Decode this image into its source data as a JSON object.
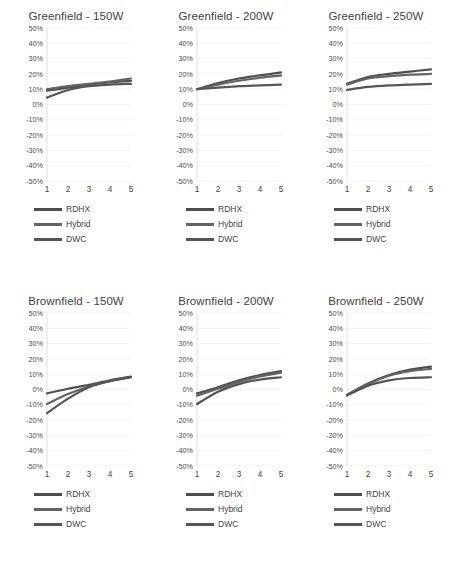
{
  "figure": {
    "series_names": [
      "RDHX",
      "Hybrid",
      "DWC"
    ],
    "series_colors": [
      "#4f4f4f",
      "#636363",
      "#555555"
    ],
    "x_categories": [
      "1",
      "2",
      "3",
      "4",
      "5"
    ],
    "y_ticks": [
      "50%",
      "40%",
      "30%",
      "20%",
      "10%",
      "0%",
      "-10%",
      "-20%",
      "-30%",
      "-40%",
      "-50%"
    ],
    "ylim": [
      -50,
      50
    ],
    "gridline_color": "#f0f0f0",
    "axis_color": "#d9d9d9"
  },
  "panels": [
    {
      "id": "greenfield-150w",
      "title": "Greenfield - 150W",
      "legend": [
        "RDHX",
        "Hybrid",
        "DWC"
      ]
    },
    {
      "id": "greenfield-200w",
      "title": "Greenfield - 200W",
      "legend": [
        "RDHX",
        "Hybrid",
        "DWC"
      ]
    },
    {
      "id": "greenfield-250w",
      "title": "Greenfield - 250W",
      "legend": [
        "RDHX",
        "Hybrid",
        "DWC"
      ]
    },
    {
      "id": "brownfield-150w",
      "title": "Brownfield - 150W",
      "legend": [
        "RDHX",
        "Hybrid",
        "DWC"
      ]
    },
    {
      "id": "brownfield-200w",
      "title": "Brownfield - 200W",
      "legend": [
        "RDHX",
        "Hybrid",
        "DWC"
      ]
    },
    {
      "id": "brownfield-250w",
      "title": "Brownfield - 250W",
      "legend": [
        "RDHX",
        "Hybrid",
        "DWC"
      ]
    }
  ],
  "chart_data": [
    {
      "type": "line",
      "title": "Greenfield - 150W",
      "xlabel": "",
      "ylabel": "",
      "x": [
        1,
        2,
        3,
        4,
        5
      ],
      "categories": [
        "1",
        "2",
        "3",
        "4",
        "5"
      ],
      "ylim": [
        -50,
        50
      ],
      "yticks": [
        -50,
        -40,
        -30,
        -20,
        -10,
        0,
        10,
        20,
        30,
        40,
        50
      ],
      "ytick_labels": [
        "-50%",
        "-40%",
        "-30%",
        "-20%",
        "-10%",
        "0%",
        "10%",
        "20%",
        "30%",
        "40%",
        "50%"
      ],
      "grid": true,
      "legend": "below",
      "series": [
        {
          "name": "RDHX",
          "values": [
            9,
            11,
            13,
            14.5,
            15.5
          ]
        },
        {
          "name": "Hybrid",
          "values": [
            10,
            12,
            13.5,
            15,
            17
          ]
        },
        {
          "name": "DWC",
          "values": [
            4.5,
            9.5,
            12,
            13,
            13.5
          ]
        }
      ]
    },
    {
      "type": "line",
      "title": "Greenfield - 200W",
      "xlabel": "",
      "ylabel": "",
      "x": [
        1,
        2,
        3,
        4,
        5
      ],
      "categories": [
        "1",
        "2",
        "3",
        "4",
        "5"
      ],
      "ylim": [
        -50,
        50
      ],
      "yticks": [
        -50,
        -40,
        -30,
        -20,
        -10,
        0,
        10,
        20,
        30,
        40,
        50
      ],
      "ytick_labels": [
        "-50%",
        "-40%",
        "-30%",
        "-20%",
        "-10%",
        "0%",
        "10%",
        "20%",
        "30%",
        "40%",
        "50%"
      ],
      "grid": true,
      "legend": "below",
      "series": [
        {
          "name": "RDHX",
          "values": [
            10,
            14,
            17,
            19,
            21
          ]
        },
        {
          "name": "Hybrid",
          "values": [
            10,
            13,
            15.5,
            17.5,
            19
          ]
        },
        {
          "name": "DWC",
          "values": [
            10,
            11,
            12,
            12.5,
            13
          ]
        }
      ]
    },
    {
      "type": "line",
      "title": "Greenfield - 250W",
      "xlabel": "",
      "ylabel": "",
      "x": [
        1,
        2,
        3,
        4,
        5
      ],
      "categories": [
        "1",
        "2",
        "3",
        "4",
        "5"
      ],
      "ylim": [
        -50,
        50
      ],
      "yticks": [
        -50,
        -40,
        -30,
        -20,
        -10,
        0,
        10,
        20,
        30,
        40,
        50
      ],
      "ytick_labels": [
        "-50%",
        "-40%",
        "-30%",
        "-20%",
        "-10%",
        "0%",
        "10%",
        "20%",
        "30%",
        "40%",
        "50%"
      ],
      "grid": true,
      "legend": "below",
      "series": [
        {
          "name": "RDHX",
          "values": [
            13.5,
            18,
            20,
            21.5,
            23
          ]
        },
        {
          "name": "Hybrid",
          "values": [
            13,
            17,
            18.5,
            19.5,
            20
          ]
        },
        {
          "name": "DWC",
          "values": [
            9.5,
            11.5,
            12.5,
            13,
            13.5
          ]
        }
      ]
    },
    {
      "type": "line",
      "title": "Brownfield - 150W",
      "xlabel": "",
      "ylabel": "",
      "x": [
        1,
        2,
        3,
        4,
        5
      ],
      "categories": [
        "1",
        "2",
        "3",
        "4",
        "5"
      ],
      "ylim": [
        -50,
        50
      ],
      "yticks": [
        -50,
        -40,
        -30,
        -20,
        -10,
        0,
        10,
        20,
        30,
        40,
        50
      ],
      "ytick_labels": [
        "-50%",
        "-40%",
        "-30%",
        "-20%",
        "-10%",
        "0%",
        "10%",
        "20%",
        "30%",
        "40%",
        "50%"
      ],
      "grid": true,
      "legend": "below",
      "series": [
        {
          "name": "RDHX",
          "values": [
            -2.5,
            0.5,
            3,
            6,
            8.5
          ]
        },
        {
          "name": "Hybrid",
          "values": [
            -9.5,
            -3,
            2,
            5.5,
            8
          ]
        },
        {
          "name": "DWC",
          "values": [
            -15.5,
            -6,
            1.5,
            5.5,
            8
          ]
        }
      ]
    },
    {
      "type": "line",
      "title": "Brownfield - 200W",
      "xlabel": "",
      "ylabel": "",
      "x": [
        1,
        2,
        3,
        4,
        5
      ],
      "categories": [
        "1",
        "2",
        "3",
        "4",
        "5"
      ],
      "ylim": [
        -50,
        50
      ],
      "yticks": [
        -50,
        -40,
        -30,
        -20,
        -10,
        0,
        10,
        20,
        30,
        40,
        50
      ],
      "ytick_labels": [
        "-50%",
        "-40%",
        "-30%",
        "-20%",
        "-10%",
        "0%",
        "10%",
        "20%",
        "30%",
        "40%",
        "50%"
      ],
      "grid": true,
      "legend": "below",
      "series": [
        {
          "name": "RDHX",
          "values": [
            -2.5,
            1.5,
            6,
            9.5,
            12
          ]
        },
        {
          "name": "Hybrid",
          "values": [
            -4,
            0.5,
            5,
            8.5,
            11
          ]
        },
        {
          "name": "DWC",
          "values": [
            -9.5,
            -1.5,
            3.5,
            6.5,
            8
          ]
        }
      ]
    },
    {
      "type": "line",
      "title": "Brownfield - 250W",
      "xlabel": "",
      "ylabel": "",
      "x": [
        1,
        2,
        3,
        4,
        5
      ],
      "categories": [
        "1",
        "2",
        "3",
        "4",
        "5"
      ],
      "ylim": [
        -50,
        50
      ],
      "yticks": [
        -50,
        -40,
        -30,
        -20,
        -10,
        0,
        10,
        20,
        30,
        40,
        50
      ],
      "ytick_labels": [
        "-50%",
        "-40%",
        "-30%",
        "-20%",
        "-10%",
        "0%",
        "10%",
        "20%",
        "30%",
        "40%",
        "50%"
      ],
      "grid": true,
      "legend": "below",
      "series": [
        {
          "name": "RDHX",
          "values": [
            -3.5,
            4,
            9.5,
            13,
            15
          ]
        },
        {
          "name": "Hybrid",
          "values": [
            -3.5,
            3.5,
            9,
            12,
            13.5
          ]
        },
        {
          "name": "DWC",
          "values": [
            -4,
            2.5,
            6,
            7.5,
            8
          ]
        }
      ]
    }
  ]
}
